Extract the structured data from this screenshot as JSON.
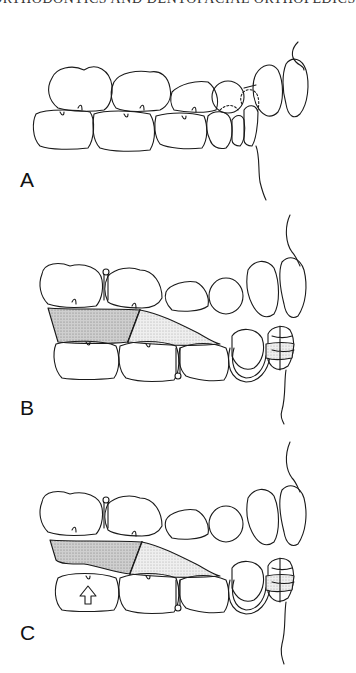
{
  "page": {
    "running_head": "ORTHODONTICS AND DENTOFACIAL ORTHOPEDICS"
  },
  "figure": {
    "panels": [
      {
        "id": "A",
        "label": "A",
        "description": "Lateral view of posterior and anterior teeth in occlusion"
      },
      {
        "id": "B",
        "label": "B",
        "description": "Appliance with shaded acrylic bite block between molars and labial clasp on anterior tooth"
      },
      {
        "id": "C",
        "label": "C",
        "description": "Appliance as in B with upward arrow on lower first molar indicating eruption"
      }
    ],
    "colors": {
      "line": "#1a1a1a",
      "block_dark": "#bdbdbd",
      "block_light": "#e2e2e2",
      "background": "#ffffff"
    }
  }
}
